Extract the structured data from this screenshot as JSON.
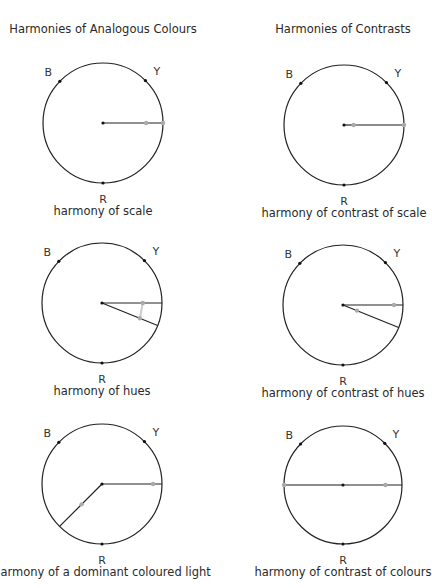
{
  "columns": [
    {
      "title": "Harmonies of Analogous Colours",
      "x": 103,
      "y": 32
    },
    {
      "title": "Harmonies of Contrasts",
      "x": 343,
      "y": 32
    }
  ],
  "poles": {
    "B": "B",
    "Y": "Y",
    "R": "R"
  },
  "diagrams": [
    {
      "caption": "harmony of scale",
      "cx": 103,
      "cy": 123,
      "r": 60,
      "col": 0,
      "row": 0,
      "arms": [
        {
          "angle": 0,
          "from": 0,
          "to": 1,
          "grey": false
        }
      ],
      "markers": [
        {
          "angle": 0,
          "t": 0.72
        },
        {
          "angle": 0,
          "t": 1.0
        }
      ]
    },
    {
      "caption": "harmony of contrast of scale",
      "cx": 344,
      "cy": 125,
      "r": 60,
      "col": 1,
      "row": 0,
      "arms": [
        {
          "angle": 0,
          "from": 0.15,
          "to": 1,
          "grey": true
        },
        {
          "angle": 0,
          "from": 0,
          "to": 0.15,
          "grey": false
        }
      ],
      "markers": [
        {
          "angle": 0,
          "t": 0.16
        },
        {
          "angle": 0,
          "t": 1.0
        }
      ]
    },
    {
      "caption": "harmony of hues",
      "cx": 102,
      "cy": 303,
      "r": 60,
      "col": 0,
      "row": 1,
      "arms": [
        {
          "angle": 0,
          "from": 0,
          "to": 1,
          "grey": false
        },
        {
          "angle": 22,
          "from": 0,
          "to": 1,
          "grey": false
        }
      ],
      "markers": [
        {
          "angle": 0,
          "t": 0.68
        },
        {
          "angle": 22,
          "t": 0.68
        }
      ],
      "connector": true
    },
    {
      "caption": "harmony of contrast  of hues",
      "cx": 343,
      "cy": 305,
      "r": 60,
      "col": 1,
      "row": 1,
      "arms": [
        {
          "angle": 0,
          "from": 0,
          "to": 1,
          "grey": false
        },
        {
          "angle": 22,
          "from": 0,
          "to": 1,
          "grey": false
        }
      ],
      "markers": [
        {
          "angle": 0,
          "t": 0.85
        },
        {
          "angle": 22,
          "t": 0.25
        }
      ]
    },
    {
      "caption": "harmony of a dominant coloured light",
      "cx": 102,
      "cy": 484,
      "r": 60,
      "col": 0,
      "row": 2,
      "arms": [
        {
          "angle": 0,
          "from": 0,
          "to": 1,
          "grey": false
        },
        {
          "angle": 135,
          "from": 0,
          "to": 1,
          "grey": false
        }
      ],
      "markers": [
        {
          "angle": 0,
          "t": 0.85
        },
        {
          "angle": 135,
          "t": 0.48
        }
      ]
    },
    {
      "caption": "harmony of contrast of colours",
      "cx": 343,
      "cy": 485,
      "r": 59,
      "col": 1,
      "row": 2,
      "arms": [
        {
          "angle": 180,
          "from": 0,
          "to": 1,
          "grey": true
        },
        {
          "angle": 0,
          "from": 0,
          "to": 1,
          "grey": false
        }
      ],
      "markers": [
        {
          "angle": 180,
          "t": 1.0
        },
        {
          "angle": 0,
          "t": 0.72
        }
      ]
    }
  ],
  "colors": {
    "line": "#222222",
    "marker": "#aaaaaa",
    "text": "#2a2a2a"
  }
}
